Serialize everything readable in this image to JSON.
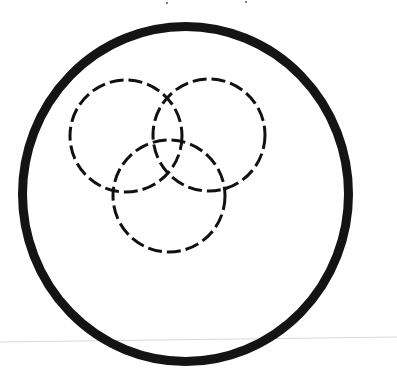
{
  "diagram": {
    "title": "",
    "description": "Three overlapping dashed circles inside a large solid circle",
    "canvas": {
      "width": 397,
      "height": 370,
      "background": "#ffffff"
    },
    "outer_circle": {
      "cx": 185.5,
      "cy": 194,
      "rx": 163,
      "ry": 167.5,
      "stroke": "#141414",
      "stroke_width": 9,
      "style": "solid"
    },
    "inner_circles": [
      {
        "id": "top-left",
        "cx": 126,
        "cy": 136,
        "r": 56,
        "stroke": "#111111",
        "stroke_width": 3,
        "dash": "14 5"
      },
      {
        "id": "top-right",
        "cx": 209,
        "cy": 135,
        "r": 56,
        "stroke": "#111111",
        "stroke_width": 3,
        "dash": "14 5"
      },
      {
        "id": "bottom",
        "cx": 169,
        "cy": 196,
        "r": 56,
        "stroke": "#111111",
        "stroke_width": 3,
        "dash": "14 5"
      }
    ],
    "scan_line": {
      "x1": 0,
      "y1": 342,
      "x2": 397,
      "y2": 337,
      "stroke": "#d8d8d8",
      "stroke_width": 1
    },
    "specks": [
      {
        "cx": 167,
        "cy": 3,
        "r": 1
      },
      {
        "cx": 246,
        "cy": 2,
        "r": 1
      }
    ]
  }
}
